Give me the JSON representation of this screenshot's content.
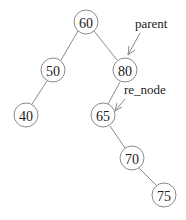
{
  "diagram": {
    "type": "binary-search-tree",
    "nodes": [
      {
        "id": "n60",
        "value": "60",
        "x": 86,
        "y": 22
      },
      {
        "id": "n50",
        "value": "50",
        "x": 53,
        "y": 70
      },
      {
        "id": "n80",
        "value": "80",
        "x": 125,
        "y": 70
      },
      {
        "id": "n40",
        "value": "40",
        "x": 26,
        "y": 115
      },
      {
        "id": "n65",
        "value": "65",
        "x": 103,
        "y": 115
      },
      {
        "id": "n70",
        "value": "70",
        "x": 132,
        "y": 158
      },
      {
        "id": "n75",
        "value": "75",
        "x": 164,
        "y": 195
      }
    ],
    "edges": [
      [
        "n60",
        "n50"
      ],
      [
        "n60",
        "n80"
      ],
      [
        "n50",
        "n40"
      ],
      [
        "n80",
        "n65"
      ],
      [
        "n65",
        "n70"
      ],
      [
        "n70",
        "n75"
      ]
    ],
    "pointers": [
      {
        "label": "parent",
        "target": "n80"
      },
      {
        "label": "re_node",
        "target": "n65"
      }
    ]
  }
}
